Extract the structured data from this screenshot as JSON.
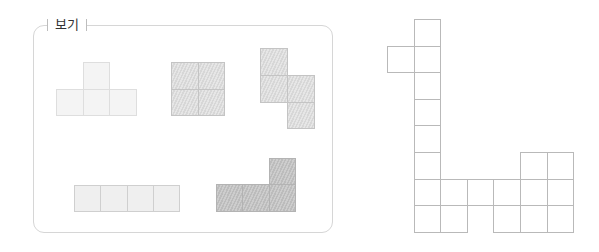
{
  "legend": {
    "label": "보기"
  },
  "pieces": [
    {
      "name": "t-tetromino",
      "style": "t-piece",
      "cell_size": 26.5,
      "origin": [
        56,
        62
      ],
      "cells": [
        [
          1,
          0
        ],
        [
          0,
          1
        ],
        [
          1,
          1
        ],
        [
          2,
          1
        ]
      ]
    },
    {
      "name": "o-tetromino",
      "style": "hatch-light",
      "cell_size": 26.5,
      "origin": [
        171,
        62
      ],
      "cells": [
        [
          0,
          0
        ],
        [
          1,
          0
        ],
        [
          0,
          1
        ],
        [
          1,
          1
        ]
      ]
    },
    {
      "name": "s-tetromino",
      "style": "hatch-light",
      "cell_size": 26.8,
      "origin": [
        260,
        48
      ],
      "cells": [
        [
          0,
          0
        ],
        [
          0,
          1
        ],
        [
          1,
          1
        ],
        [
          1,
          2
        ]
      ]
    },
    {
      "name": "i-tetromino",
      "style": "i-piece",
      "cell_size": 26.3,
      "origin": [
        74,
        185
      ],
      "cells": [
        [
          0,
          0
        ],
        [
          1,
          0
        ],
        [
          2,
          0
        ],
        [
          3,
          0
        ]
      ]
    },
    {
      "name": "l-tetromino",
      "style": "hatch-dark",
      "cell_size": 26.3,
      "origin": [
        216,
        158
      ],
      "cells": [
        [
          2,
          0
        ],
        [
          0,
          1
        ],
        [
          1,
          1
        ],
        [
          2,
          1
        ]
      ]
    }
  ],
  "net": {
    "name": "target-net-grid",
    "cell_size": 26.6,
    "origin": [
      387,
      19
    ],
    "cells": [
      [
        1,
        0
      ],
      [
        0,
        1
      ],
      [
        1,
        1
      ],
      [
        1,
        2
      ],
      [
        1,
        3
      ],
      [
        1,
        4
      ],
      [
        1,
        5
      ],
      [
        5,
        5
      ],
      [
        6,
        5
      ],
      [
        1,
        6
      ],
      [
        2,
        6
      ],
      [
        3,
        6
      ],
      [
        4,
        6
      ],
      [
        5,
        6
      ],
      [
        6,
        6
      ],
      [
        1,
        7
      ],
      [
        2,
        7
      ],
      [
        4,
        7
      ],
      [
        5,
        7
      ],
      [
        6,
        7
      ]
    ]
  }
}
